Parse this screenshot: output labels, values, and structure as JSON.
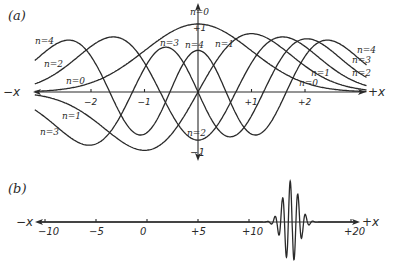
{
  "figure": {
    "panel_a": {
      "label": "(a)",
      "x_axis": {
        "neg_label": "−x",
        "pos_label": "+x",
        "ticks": [
          "−2",
          "−1",
          "+1",
          "+2"
        ],
        "tick_values": [
          -2,
          -1,
          1,
          2
        ]
      },
      "y_axis": {
        "top_label": "+1",
        "bottom_label": "−1"
      },
      "curve_labels": [
        {
          "text": "n=4",
          "x": 35,
          "y": 44
        },
        {
          "text": "n=2",
          "x": 44,
          "y": 67
        },
        {
          "text": "n=0",
          "x": 66,
          "y": 84
        },
        {
          "text": "n=1",
          "x": 62,
          "y": 119
        },
        {
          "text": "n=3",
          "x": 40,
          "y": 135
        },
        {
          "text": "n=3",
          "x": 160,
          "y": 46
        },
        {
          "text": "n=4",
          "x": 185,
          "y": 48
        },
        {
          "text": "n=0",
          "x": 190,
          "y": 15
        },
        {
          "text": "n=1",
          "x": 215,
          "y": 47
        },
        {
          "text": "n=2",
          "x": 187,
          "y": 136
        },
        {
          "text": "n=4",
          "x": 357,
          "y": 53
        },
        {
          "text": "n=3",
          "x": 352,
          "y": 63
        },
        {
          "text": "n=2",
          "x": 352,
          "y": 76
        },
        {
          "text": "n=1",
          "x": 311,
          "y": 76
        },
        {
          "text": "n=0",
          "x": 299,
          "y": 86
        }
      ]
    },
    "panel_b": {
      "label": "(b)",
      "x_axis": {
        "neg_label": "−x",
        "pos_label": "+x",
        "ticks": [
          "−10",
          "−5",
          "0",
          "+5",
          "+10",
          "+20"
        ],
        "tick_values": [
          -10,
          -5,
          0,
          5,
          10,
          20
        ]
      }
    }
  },
  "chart_data": [
    {
      "type": "line",
      "title": "(a)",
      "description": "Harmonic oscillator eigenfunctions ψn(x) for n = 0..4, scaled so ψ0(0) = +1",
      "xlabel": "x",
      "ylabel": "ψ",
      "xlim": [
        -3.1,
        3.1
      ],
      "ylim": [
        -1,
        1
      ],
      "x_ticks": [
        -2,
        -1,
        1,
        2
      ],
      "y_ticks": [
        1,
        -1
      ],
      "grid": false,
      "legend": "inline labels n=0..4",
      "x": [
        -3,
        -2.5,
        -2,
        -1.5,
        -1,
        -0.5,
        0,
        0.5,
        1,
        1.5,
        2,
        2.5,
        3
      ],
      "series": [
        {
          "name": "n=0",
          "values": [
            0.01,
            0.04,
            0.14,
            0.32,
            0.61,
            0.88,
            1.0,
            0.88,
            0.61,
            0.32,
            0.14,
            0.04,
            0.01
          ]
        },
        {
          "name": "n=1",
          "values": [
            -0.05,
            -0.16,
            -0.38,
            -0.69,
            -0.86,
            -0.62,
            0.0,
            0.62,
            0.86,
            0.69,
            0.38,
            0.16,
            0.05
          ]
        },
        {
          "name": "n=2",
          "values": [
            0.12,
            0.32,
            0.61,
            0.69,
            0.22,
            -0.44,
            -0.71,
            -0.44,
            0.22,
            0.69,
            0.61,
            0.32,
            0.12
          ]
        },
        {
          "name": "n=3",
          "values": [
            -0.22,
            -0.49,
            -0.67,
            -0.3,
            0.35,
            0.56,
            0.0,
            -0.56,
            -0.35,
            0.3,
            0.67,
            0.49,
            0.22
          ]
        },
        {
          "name": "n=4",
          "values": [
            0.36,
            0.63,
            0.53,
            -0.15,
            -0.41,
            0.07,
            0.61,
            0.07,
            -0.41,
            -0.15,
            0.53,
            0.63,
            0.36
          ]
        }
      ]
    },
    {
      "type": "line",
      "title": "(b)",
      "description": "Gaussian wave packet centered near x ≈ +14",
      "xlabel": "x",
      "xlim": [
        -11,
        21
      ],
      "x_ticks": [
        -10,
        -5,
        0,
        5,
        10,
        20
      ],
      "grid": false,
      "packet": {
        "center": 14.1,
        "width": 1.1,
        "wavelength": 0.75,
        "amplitude": 1.0
      }
    }
  ],
  "render": {
    "a": {
      "x0": 198,
      "y0": 92,
      "sx": 53.5,
      "sy": 68,
      "xmin": -3.05,
      "xmax": 3.15
    },
    "b": {
      "x0": 147,
      "y0": 222,
      "sx": 10.2,
      "sy": 41,
      "xmin": -10.5,
      "xmax": 20.3
    }
  }
}
